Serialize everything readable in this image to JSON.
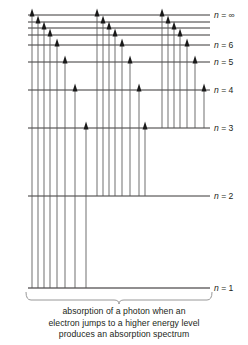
{
  "figure": {
    "background_color": "#ffffff",
    "line_color": "#231f20",
    "arrow_color": "#555555",
    "brace_color": "#8d8d8d"
  },
  "axis": {
    "left_x": 28,
    "right_x": 210,
    "label_x": 214
  },
  "levels": [
    {
      "id": "n-infinity",
      "label_n": "n",
      "label_eq": "=",
      "label_value": "∞",
      "y": 15,
      "labeled": true,
      "label_text": "n = ∞"
    },
    {
      "id": "n-9",
      "label_n": "n",
      "label_eq": "=",
      "label_value": "9",
      "y": 22,
      "labeled": false,
      "label_text": ""
    },
    {
      "id": "n-8",
      "label_n": "n",
      "label_eq": "=",
      "label_value": "8",
      "y": 28,
      "labeled": false,
      "label_text": ""
    },
    {
      "id": "n-7",
      "label_n": "n",
      "label_eq": "=",
      "label_value": "7",
      "y": 35,
      "labeled": false,
      "label_text": ""
    },
    {
      "id": "n-6",
      "label_n": "n",
      "label_eq": "=",
      "label_value": "6",
      "y": 45,
      "labeled": true,
      "label_text": "n = 6"
    },
    {
      "id": "n-5",
      "label_n": "n",
      "label_eq": "=",
      "label_value": "5",
      "y": 62,
      "labeled": true,
      "label_text": "n = 5"
    },
    {
      "id": "n-4",
      "label_n": "n",
      "label_eq": "=",
      "label_value": "4",
      "y": 90,
      "labeled": true,
      "label_text": "n = 4"
    },
    {
      "id": "n-3",
      "label_n": "n",
      "label_eq": "=",
      "label_value": "3",
      "y": 128,
      "labeled": true,
      "label_text": "n = 3"
    },
    {
      "id": "n-2",
      "label_n": "n",
      "label_eq": "=",
      "label_value": "2",
      "y": 196,
      "labeled": true,
      "label_text": "n = 2"
    },
    {
      "id": "n-1",
      "label_n": "n",
      "label_eq": "=",
      "label_value": "1",
      "y": 288,
      "labeled": true,
      "label_text": "n = 1"
    }
  ],
  "transitions": [
    {
      "id": "t-1-inf",
      "from_level": "n-1",
      "to_level": "n-infinity",
      "x": 32,
      "y_from": 288,
      "y_to": 15
    },
    {
      "id": "t-1-9",
      "from_level": "n-1",
      "to_level": "n-9",
      "x": 38,
      "y_from": 288,
      "y_to": 22
    },
    {
      "id": "t-1-8",
      "from_level": "n-1",
      "to_level": "n-8",
      "x": 44,
      "y_from": 288,
      "y_to": 28
    },
    {
      "id": "t-1-7",
      "from_level": "n-1",
      "to_level": "n-7",
      "x": 50,
      "y_from": 288,
      "y_to": 35
    },
    {
      "id": "t-1-6",
      "from_level": "n-1",
      "to_level": "n-6",
      "x": 57,
      "y_from": 288,
      "y_to": 45
    },
    {
      "id": "t-1-5",
      "from_level": "n-1",
      "to_level": "n-5",
      "x": 65,
      "y_from": 288,
      "y_to": 62
    },
    {
      "id": "t-1-4",
      "from_level": "n-1",
      "to_level": "n-4",
      "x": 75,
      "y_from": 288,
      "y_to": 90
    },
    {
      "id": "t-1-3",
      "from_level": "n-1",
      "to_level": "n-3",
      "x": 86,
      "y_from": 288,
      "y_to": 128
    },
    {
      "id": "t-2-inf",
      "from_level": "n-2",
      "to_level": "n-infinity",
      "x": 97,
      "y_from": 196,
      "y_to": 15
    },
    {
      "id": "t-2-9",
      "from_level": "n-2",
      "to_level": "n-9",
      "x": 103,
      "y_from": 196,
      "y_to": 22
    },
    {
      "id": "t-2-8",
      "from_level": "n-2",
      "to_level": "n-8",
      "x": 109,
      "y_from": 196,
      "y_to": 28
    },
    {
      "id": "t-2-7",
      "from_level": "n-2",
      "to_level": "n-7",
      "x": 115,
      "y_from": 196,
      "y_to": 35
    },
    {
      "id": "t-2-6",
      "from_level": "n-2",
      "to_level": "n-6",
      "x": 122,
      "y_from": 196,
      "y_to": 45
    },
    {
      "id": "t-2-5",
      "from_level": "n-2",
      "to_level": "n-5",
      "x": 130,
      "y_from": 196,
      "y_to": 62
    },
    {
      "id": "t-2-4",
      "from_level": "n-2",
      "to_level": "n-4",
      "x": 139,
      "y_from": 196,
      "y_to": 90
    },
    {
      "id": "t-2-3",
      "from_level": "n-2",
      "to_level": "n-3",
      "x": 145,
      "y_from": 196,
      "y_to": 128
    },
    {
      "id": "t-3-inf",
      "from_level": "n-3",
      "to_level": "n-infinity",
      "x": 162,
      "y_from": 128,
      "y_to": 15
    },
    {
      "id": "t-3-9",
      "from_level": "n-3",
      "to_level": "n-9",
      "x": 168,
      "y_from": 128,
      "y_to": 22
    },
    {
      "id": "t-3-8",
      "from_level": "n-3",
      "to_level": "n-8",
      "x": 174,
      "y_from": 128,
      "y_to": 28
    },
    {
      "id": "t-3-7",
      "from_level": "n-3",
      "to_level": "n-7",
      "x": 180,
      "y_from": 128,
      "y_to": 35
    },
    {
      "id": "t-3-6",
      "from_level": "n-3",
      "to_level": "n-6",
      "x": 187,
      "y_from": 128,
      "y_to": 45
    },
    {
      "id": "t-3-5",
      "from_level": "n-3",
      "to_level": "n-5",
      "x": 195,
      "y_from": 128,
      "y_to": 62
    },
    {
      "id": "t-3-4",
      "from_level": "n-3",
      "to_level": "n-4",
      "x": 204,
      "y_from": 128,
      "y_to": 90
    }
  ],
  "caption": {
    "line1": "absorption of a photon when an",
    "line2": "electron jumps to a higher energy level",
    "line3": "produces an absorption spectrum"
  },
  "brace": {
    "left_x": 26,
    "right_x": 212,
    "y": 292,
    "depth": 8
  }
}
